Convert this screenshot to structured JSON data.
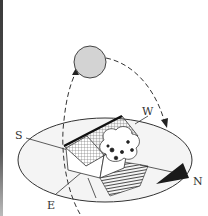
{
  "diagram": {
    "type": "sun-path-diagram",
    "compass": {
      "south": "S",
      "west": "W",
      "north": "N",
      "east": "E"
    },
    "elements": {
      "sun": "sun-icon",
      "sun_path": "dashed-arc-east-to-west",
      "house": "house-icon",
      "tree": "tree-icon",
      "shadow": "shadow-area",
      "north_arrow": "north-arrow-icon"
    },
    "colors": {
      "sun_fill": "#d3d3d3",
      "stroke": "#333333",
      "ground_fill": "#f4f4f4",
      "shadow": "#444444",
      "background": "#ffffff"
    }
  }
}
